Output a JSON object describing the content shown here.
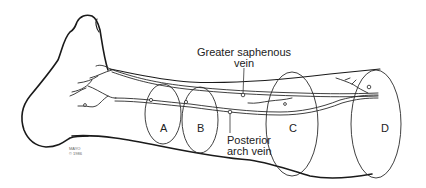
{
  "figure": {
    "labels": {
      "greater_saphenous": [
        "Greater saphenous",
        "vein"
      ],
      "posterior_arch": [
        "Posterior",
        "arch vein"
      ]
    },
    "sections": [
      {
        "id": "A",
        "label": "A"
      },
      {
        "id": "B",
        "label": "B"
      },
      {
        "id": "C",
        "label": "C"
      },
      {
        "id": "D",
        "label": "D"
      }
    ],
    "credit": [
      "MAYO",
      "© 1986"
    ],
    "colors": {
      "line": "#1a1a1a",
      "background": "#ffffff",
      "text": "#222222"
    }
  }
}
